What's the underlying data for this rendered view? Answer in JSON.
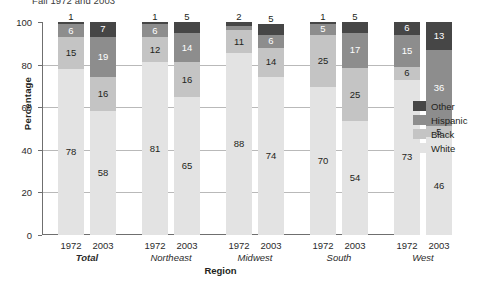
{
  "chart_data": {
    "type": "bar",
    "subtype": "stacked-bar-100",
    "title": "Fall 1972 and 2003",
    "xlabel": "Region",
    "ylabel": "Percentage",
    "ylim": [
      0,
      100
    ],
    "yticks": [
      0,
      20,
      40,
      60,
      80,
      100
    ],
    "grid": true,
    "legend_position": "right",
    "legend": [
      "Other",
      "Hispanic",
      "Black",
      "White"
    ],
    "colors": {
      "Other": "#464646",
      "Hispanic": "#8d8d8d",
      "Black": "#c4c4c4",
      "White": "#e3e3e3",
      "gridline": "#b9b9b9",
      "axis": "#6f6f6f"
    },
    "groups": [
      "Total",
      "Northeast",
      "Midwest",
      "South",
      "West"
    ],
    "years": [
      "1972",
      "2003"
    ],
    "categories": [
      "1972 Total",
      "2003 Total",
      "1972 Northeast",
      "2003 Northeast",
      "1972 Midwest",
      "2003 Midwest",
      "1972 South",
      "2003 South",
      "1972 West",
      "2003 West"
    ],
    "series": [
      {
        "name": "White",
        "values": [
          78,
          58,
          81,
          65,
          88,
          74,
          70,
          54,
          73,
          46
        ]
      },
      {
        "name": "Black",
        "values": [
          15,
          16,
          12,
          16,
          11,
          14,
          25,
          25,
          6,
          5
        ]
      },
      {
        "name": "Hispanic",
        "values": [
          6,
          19,
          6,
          14,
          2,
          6,
          5,
          17,
          15,
          36
        ]
      },
      {
        "name": "Other",
        "values": [
          1,
          7,
          1,
          5,
          2,
          5,
          1,
          5,
          6,
          13
        ]
      }
    ]
  },
  "bars": [
    {
      "group": "Total",
      "year": "1972",
      "segments": [
        {
          "name": "White",
          "value": 78,
          "label": "78",
          "label_pos": "inside",
          "label_tone": "light"
        },
        {
          "name": "Black",
          "value": 15,
          "label": "15",
          "label_pos": "inside",
          "label_tone": "light"
        },
        {
          "name": "Hispanic",
          "value": 6,
          "label": "6",
          "label_pos": "inside",
          "label_tone": "dark"
        },
        {
          "name": "Other",
          "value": 1,
          "label": "1",
          "label_pos": "above",
          "label_tone": "light"
        }
      ]
    },
    {
      "group": "Total",
      "year": "2003",
      "segments": [
        {
          "name": "White",
          "value": 58,
          "label": "58",
          "label_pos": "inside",
          "label_tone": "light"
        },
        {
          "name": "Black",
          "value": 16,
          "label": "16",
          "label_pos": "inside",
          "label_tone": "light"
        },
        {
          "name": "Hispanic",
          "value": 19,
          "label": "19",
          "label_pos": "inside",
          "label_tone": "dark"
        },
        {
          "name": "Other",
          "value": 7,
          "label": "7",
          "label_pos": "inside",
          "label_tone": "dark"
        }
      ]
    },
    {
      "group": "Northeast",
      "year": "1972",
      "segments": [
        {
          "name": "White",
          "value": 81,
          "label": "81",
          "label_pos": "inside",
          "label_tone": "light"
        },
        {
          "name": "Black",
          "value": 12,
          "label": "12",
          "label_pos": "inside",
          "label_tone": "light"
        },
        {
          "name": "Hispanic",
          "value": 6,
          "label": "6",
          "label_pos": "inside",
          "label_tone": "dark"
        },
        {
          "name": "Other",
          "value": 1,
          "label": "1",
          "label_pos": "above",
          "label_tone": "light"
        }
      ]
    },
    {
      "group": "Northeast",
      "year": "2003",
      "segments": [
        {
          "name": "White",
          "value": 65,
          "label": "65",
          "label_pos": "inside",
          "label_tone": "light"
        },
        {
          "name": "Black",
          "value": 16,
          "label": "16",
          "label_pos": "inside",
          "label_tone": "light"
        },
        {
          "name": "Hispanic",
          "value": 14,
          "label": "14",
          "label_pos": "inside",
          "label_tone": "dark"
        },
        {
          "name": "Other",
          "value": 5,
          "label": "5",
          "label_pos": "above",
          "label_tone": "light"
        }
      ]
    },
    {
      "group": "Midwest",
      "year": "1972",
      "segments": [
        {
          "name": "White",
          "value": 88,
          "label": "88",
          "label_pos": "inside",
          "label_tone": "light"
        },
        {
          "name": "Black",
          "value": 11,
          "label": "11",
          "label_pos": "inside",
          "label_tone": "light"
        },
        {
          "name": "Hispanic",
          "value": 2,
          "label": "",
          "label_pos": "none",
          "label_tone": "dark"
        },
        {
          "name": "Other",
          "value": 2,
          "label": "2",
          "label_pos": "above",
          "label_tone": "light"
        }
      ]
    },
    {
      "group": "Midwest",
      "year": "2003",
      "segments": [
        {
          "name": "White",
          "value": 74,
          "label": "74",
          "label_pos": "inside",
          "label_tone": "light"
        },
        {
          "name": "Black",
          "value": 14,
          "label": "14",
          "label_pos": "inside",
          "label_tone": "light"
        },
        {
          "name": "Hispanic",
          "value": 6,
          "label": "6",
          "label_pos": "inside",
          "label_tone": "dark"
        },
        {
          "name": "Other",
          "value": 5,
          "label": "5",
          "label_pos": "above",
          "label_tone": "light"
        }
      ]
    },
    {
      "group": "South",
      "year": "1972",
      "segments": [
        {
          "name": "White",
          "value": 70,
          "label": "70",
          "label_pos": "inside",
          "label_tone": "light"
        },
        {
          "name": "Black",
          "value": 25,
          "label": "25",
          "label_pos": "inside",
          "label_tone": "light"
        },
        {
          "name": "Hispanic",
          "value": 5,
          "label": "5",
          "label_pos": "inside",
          "label_tone": "dark"
        },
        {
          "name": "Other",
          "value": 1,
          "label": "1",
          "label_pos": "above",
          "label_tone": "light"
        }
      ]
    },
    {
      "group": "South",
      "year": "2003",
      "segments": [
        {
          "name": "White",
          "value": 54,
          "label": "54",
          "label_pos": "inside",
          "label_tone": "light"
        },
        {
          "name": "Black",
          "value": 25,
          "label": "25",
          "label_pos": "inside",
          "label_tone": "light"
        },
        {
          "name": "Hispanic",
          "value": 17,
          "label": "17",
          "label_pos": "inside",
          "label_tone": "dark"
        },
        {
          "name": "Other",
          "value": 5,
          "label": "5",
          "label_pos": "above",
          "label_tone": "light"
        }
      ]
    },
    {
      "group": "West",
      "year": "1972",
      "segments": [
        {
          "name": "White",
          "value": 73,
          "label": "73",
          "label_pos": "inside",
          "label_tone": "light"
        },
        {
          "name": "Black",
          "value": 6,
          "label": "6",
          "label_pos": "inside",
          "label_tone": "light"
        },
        {
          "name": "Hispanic",
          "value": 15,
          "label": "15",
          "label_pos": "inside",
          "label_tone": "dark"
        },
        {
          "name": "Other",
          "value": 6,
          "label": "6",
          "label_pos": "inside",
          "label_tone": "dark"
        }
      ]
    },
    {
      "group": "West",
      "year": "2003",
      "segments": [
        {
          "name": "White",
          "value": 46,
          "label": "46",
          "label_pos": "inside",
          "label_tone": "light"
        },
        {
          "name": "Black",
          "value": 5,
          "label": "5",
          "label_pos": "inside",
          "label_tone": "light"
        },
        {
          "name": "Hispanic",
          "value": 36,
          "label": "36",
          "label_pos": "inside",
          "label_tone": "dark"
        },
        {
          "name": "Other",
          "value": 13,
          "label": "13",
          "label_pos": "inside",
          "label_tone": "dark"
        }
      ]
    }
  ]
}
